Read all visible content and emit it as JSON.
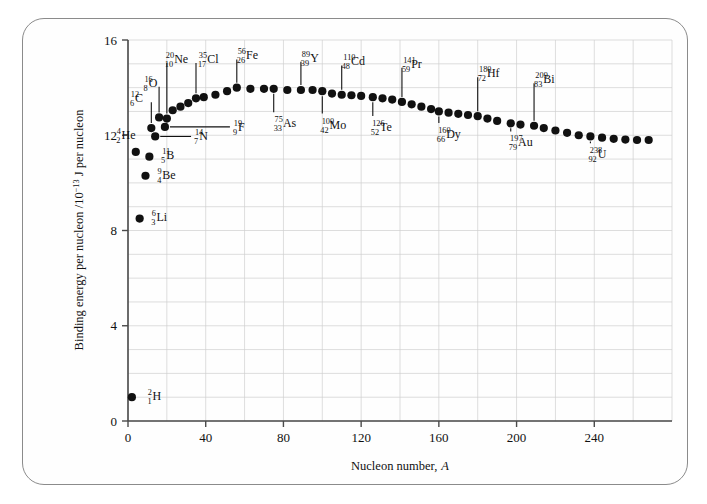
{
  "figure": {
    "frame_color": "#8b8b8b",
    "background": "#ffffff"
  },
  "chart_data": {
    "type": "scatter",
    "title": "",
    "xlabel": "Nucleon number, A",
    "xlabel_text": "Nucleon number,",
    "xlabel_symbol": "A",
    "ylabel_text": "Binding energy per nucleon /10",
    "ylabel_exponent": "−13",
    "ylabel_tail": " J per nucleon",
    "ylabel": "Binding energy per nucleon /10^-13 J per nucleon",
    "xlim": [
      0,
      280
    ],
    "ylim": [
      0,
      16
    ],
    "xticks": [
      0,
      40,
      80,
      120,
      160,
      200,
      240
    ],
    "yticks": [
      0,
      4,
      8,
      12,
      16
    ],
    "xtick_labels": [
      "0",
      "40",
      "80",
      "120",
      "160",
      "200",
      "240"
    ],
    "ytick_labels": [
      "0",
      "4",
      "8",
      "12",
      "16"
    ],
    "grid": true,
    "grid_x_step": 20,
    "grid_y_step": 1,
    "legend": "none",
    "marker": "filled-circle",
    "marker_color": "#111111",
    "x": [
      2,
      4,
      6,
      9,
      11,
      12,
      14,
      16,
      19,
      20,
      23,
      27,
      31,
      35,
      39,
      45,
      51,
      56,
      63,
      70,
      75,
      82,
      89,
      95,
      100,
      105,
      110,
      115,
      120,
      126,
      131,
      136,
      141,
      146,
      151,
      156,
      160,
      165,
      170,
      175,
      180,
      185,
      190,
      197,
      202,
      209,
      214,
      220,
      226,
      232,
      238,
      244,
      250,
      256,
      262,
      268
    ],
    "y": [
      1.0,
      11.3,
      8.5,
      10.3,
      11.1,
      12.3,
      11.95,
      12.75,
      12.35,
      12.7,
      13.05,
      13.2,
      13.35,
      13.55,
      13.6,
      13.7,
      13.85,
      14.0,
      13.95,
      13.95,
      13.95,
      13.9,
      13.9,
      13.9,
      13.85,
      13.75,
      13.7,
      13.68,
      13.65,
      13.6,
      13.55,
      13.5,
      13.4,
      13.3,
      13.2,
      13.1,
      13.0,
      12.95,
      12.9,
      12.85,
      12.8,
      12.7,
      12.6,
      12.5,
      12.45,
      12.4,
      12.3,
      12.2,
      12.1,
      12.0,
      11.95,
      11.9,
      11.85,
      11.82,
      11.8,
      11.8
    ],
    "annotations": [
      {
        "label": "H",
        "mass": "2",
        "atomic": "1",
        "x": 2,
        "y": 1.0,
        "text_x": 10,
        "text_y": 1.05,
        "leader": "none"
      },
      {
        "label": "He",
        "mass": "4",
        "atomic": "2",
        "x": 4,
        "y": 11.3,
        "text_x": -6,
        "text_y": 12.0,
        "leader": "none"
      },
      {
        "label": "Li",
        "mass": "6",
        "atomic": "3",
        "x": 6,
        "y": 8.5,
        "text_x": 12,
        "text_y": 8.55,
        "leader": "none"
      },
      {
        "label": "Be",
        "mass": "9",
        "atomic": "4",
        "x": 9,
        "y": 10.3,
        "text_x": 15,
        "text_y": 10.35,
        "leader": "none"
      },
      {
        "label": "B",
        "mass": "11",
        "atomic": "5",
        "x": 11,
        "y": 11.1,
        "text_x": 17,
        "text_y": 11.15,
        "leader": "none"
      },
      {
        "label": "C",
        "mass": "12",
        "atomic": "6",
        "x": 12,
        "y": 12.3,
        "text_x": 2,
        "text_y": 13.55,
        "leader": "vertical"
      },
      {
        "label": "N",
        "mass": "14",
        "atomic": "7",
        "x": 14,
        "y": 11.95,
        "text_x": 34,
        "text_y": 11.95,
        "leader": "horizontal"
      },
      {
        "label": "O",
        "mass": "16",
        "atomic": "8",
        "x": 16,
        "y": 12.75,
        "text_x": 9,
        "text_y": 14.2,
        "leader": "vertical"
      },
      {
        "label": "F",
        "mass": "19",
        "atomic": "9",
        "x": 19,
        "y": 12.35,
        "text_x": 54,
        "text_y": 12.35,
        "leader": "horizontal"
      },
      {
        "label": "Ne",
        "mass": "20",
        "atomic": "10",
        "x": 20,
        "y": 12.7,
        "text_x": 20,
        "text_y": 15.2,
        "leader": "vertical"
      },
      {
        "label": "Cl",
        "mass": "35",
        "atomic": "17",
        "x": 35,
        "y": 13.55,
        "text_x": 37,
        "text_y": 15.2,
        "leader": "vertical"
      },
      {
        "label": "Fe",
        "mass": "56",
        "atomic": "26",
        "x": 56,
        "y": 14.0,
        "text_x": 57,
        "text_y": 15.35,
        "leader": "vertical"
      },
      {
        "label": "As",
        "mass": "75",
        "atomic": "33",
        "x": 75,
        "y": 13.95,
        "text_x": 76,
        "text_y": 12.5,
        "leader": "vertical"
      },
      {
        "label": "Y",
        "mass": "89",
        "atomic": "39",
        "x": 89,
        "y": 13.9,
        "text_x": 90,
        "text_y": 15.25,
        "leader": "vertical"
      },
      {
        "label": "Mo",
        "mass": "100",
        "atomic": "42",
        "x": 100,
        "y": 13.85,
        "text_x": 100,
        "text_y": 12.45,
        "leader": "vertical"
      },
      {
        "label": "Cd",
        "mass": "110",
        "atomic": "48",
        "x": 110,
        "y": 13.7,
        "text_x": 111,
        "text_y": 15.1,
        "leader": "vertical"
      },
      {
        "label": "Te",
        "mass": "126",
        "atomic": "52",
        "x": 126,
        "y": 13.6,
        "text_x": 126,
        "text_y": 12.35,
        "leader": "vertical"
      },
      {
        "label": "Pr",
        "mass": "141",
        "atomic": "59",
        "x": 141,
        "y": 13.4,
        "text_x": 142,
        "text_y": 15.0,
        "leader": "vertical"
      },
      {
        "label": "Dy",
        "mass": "160",
        "atomic": "66",
        "x": 160,
        "y": 13.0,
        "text_x": 160,
        "text_y": 12.05,
        "leader": "vertical"
      },
      {
        "label": "Hf",
        "mass": "180",
        "atomic": "72",
        "x": 180,
        "y": 12.8,
        "text_x": 181,
        "text_y": 14.6,
        "leader": "vertical"
      },
      {
        "label": "Au",
        "mass": "197",
        "atomic": "79",
        "x": 197,
        "y": 12.5,
        "text_x": 197,
        "text_y": 11.7,
        "leader": "vertical"
      },
      {
        "label": "Bi",
        "mass": "209",
        "atomic": "83",
        "x": 209,
        "y": 12.4,
        "text_x": 210,
        "text_y": 14.35,
        "leader": "vertical"
      },
      {
        "label": "U",
        "mass": "238",
        "atomic": "92",
        "x": 238,
        "y": 11.95,
        "text_x": 238,
        "text_y": 11.2,
        "leader": "vertical"
      }
    ]
  }
}
